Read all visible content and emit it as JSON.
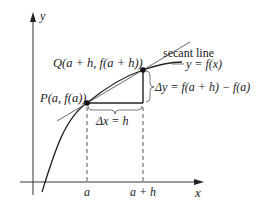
{
  "axes": {
    "x_label": "x",
    "y_label": "y"
  },
  "points": {
    "P": "P(a, f(a))",
    "Q": "Q(a + h, f(a + h))"
  },
  "labels": {
    "secant": "secant line",
    "curve": "y = f(x)",
    "delta_y": "Δy = f(a + h) − f(a)",
    "delta_x": "Δx = h",
    "tick_a": "a",
    "tick_a_plus_h": "a + h"
  },
  "colors": {
    "line": "#222222",
    "secant": "#555555"
  }
}
